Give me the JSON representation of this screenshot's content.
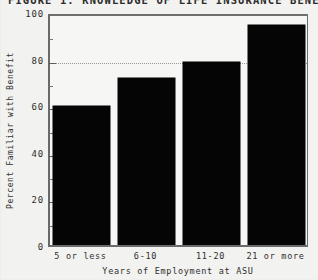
{
  "figure": {
    "title": "FIGURE 1.  KNOWLEDGE OF LIFE INSURANCE BENEFIT",
    "title_clipped": "true"
  },
  "chart_data": {
    "type": "bar",
    "title": "FIGURE 1.  KNOWLEDGE OF LIFE INSURANCE BENEFIT",
    "subtitle": "",
    "categories": [
      "5 or less",
      "6-10",
      "11-20",
      "21 or more"
    ],
    "values": [
      60,
      72,
      79,
      95
    ],
    "series": [
      {
        "name": "Percent Familiar with Benefit",
        "values": [
          60,
          72,
          79,
          95
        ]
      }
    ],
    "xlabel": "Years of Employment at ASU",
    "ylabel": "Percent Familiar with Benefit",
    "ylim": [
      0,
      100
    ],
    "yticks": [
      0,
      20,
      40,
      60,
      80,
      100
    ],
    "ytick_labels": [
      "0",
      "20",
      "40",
      "60",
      "80",
      "100"
    ],
    "yminor_ticks": [
      10,
      30,
      50,
      70,
      90
    ],
    "gridlines": [
      80
    ],
    "grid": "horizontal-dotted-at-80",
    "legend": "none",
    "legend_position": "none",
    "bar_color": "#050505",
    "plot_background": "#f6f6f4",
    "axis_color": "#6a6a6a",
    "grid_color": "#9a9a9a"
  },
  "axes": {
    "y_title": "Percent Familiar with Benefit",
    "x_title": "Years of Employment at ASU"
  }
}
